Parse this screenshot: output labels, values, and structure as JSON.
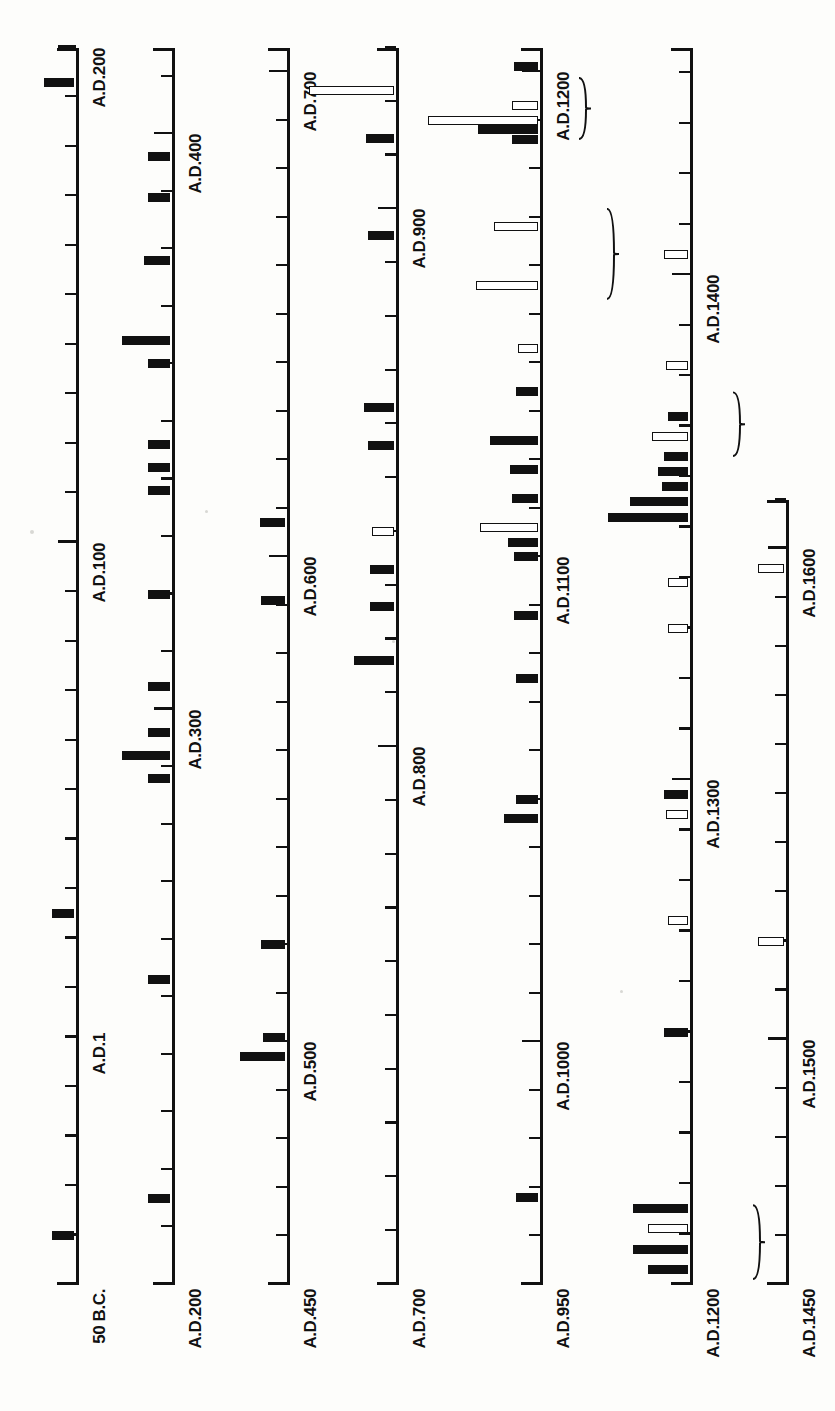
{
  "figure": {
    "orientation": "rotated-90-ccw",
    "background_color": "#fdfdfb",
    "ink_color": "#111111"
  },
  "chart_data": {
    "type": "bar",
    "xlabel": "",
    "ylabel": "",
    "grid": false,
    "legend": [],
    "note": "Seven stacked horizontal timeline axes (printed rotated 90 degrees). Each axis spans a date range with minor ticks every 10 years and labelled major ticks every 100 years (50 years on the later panels). Bars extend perpendicular from the axis; solid black bars and hollow (outlined) bars are two different categories. Curly braces group adjacent bars.",
    "rows": [
      {
        "index": 1,
        "start_label": "50 B.C.",
        "end_label": "A.D.200",
        "start_value": -50,
        "end_value": 200,
        "tick_step": 10,
        "major_ticks": [
          {
            "value": 1,
            "label": "A.D.1"
          },
          {
            "value": 100,
            "label": "A.D.100"
          },
          {
            "value": 200,
            "label": "A.D.200"
          }
        ],
        "bars": [
          {
            "value": -40,
            "length": 22,
            "style": "filled"
          },
          {
            "value": 25,
            "length": 22,
            "style": "filled"
          },
          {
            "value": 193,
            "length": 30,
            "style": "filled"
          }
        ]
      },
      {
        "index": 2,
        "start_label": "A.D.200",
        "end_label": "A.D.400",
        "start_value": 200,
        "end_value": 415,
        "tick_step": 10,
        "major_ticks": [
          {
            "value": 200,
            "label": "A.D.200"
          },
          {
            "value": 300,
            "label": "A.D.300"
          },
          {
            "value": 400,
            "label": "A.D.400"
          }
        ],
        "bars": [
          {
            "value": 215,
            "length": 22,
            "style": "filled"
          },
          {
            "value": 253,
            "length": 22,
            "style": "filled"
          },
          {
            "value": 288,
            "length": 22,
            "style": "filled"
          },
          {
            "value": 292,
            "length": 48,
            "style": "filled"
          },
          {
            "value": 296,
            "length": 22,
            "style": "filled"
          },
          {
            "value": 304,
            "length": 22,
            "style": "filled"
          },
          {
            "value": 320,
            "length": 22,
            "style": "filled"
          },
          {
            "value": 338,
            "length": 22,
            "style": "filled"
          },
          {
            "value": 342,
            "length": 22,
            "style": "filled"
          },
          {
            "value": 346,
            "length": 22,
            "style": "filled"
          },
          {
            "value": 360,
            "length": 22,
            "style": "filled"
          },
          {
            "value": 364,
            "length": 48,
            "style": "filled"
          },
          {
            "value": 378,
            "length": 26,
            "style": "filled"
          },
          {
            "value": 389,
            "length": 22,
            "style": "filled"
          },
          {
            "value": 396,
            "length": 22,
            "style": "filled"
          }
        ]
      },
      {
        "index": 3,
        "start_label": "A.D.450",
        "end_label": "A.D.700",
        "start_value": 450,
        "end_value": 705,
        "tick_step": 10,
        "major_ticks": [
          {
            "value": 500,
            "label": "A.D.500"
          },
          {
            "value": 600,
            "label": "A.D.600"
          },
          {
            "value": 700,
            "label": "A.D.700"
          }
        ],
        "bars": [
          {
            "value": 497,
            "length": 45,
            "style": "filled"
          },
          {
            "value": 501,
            "length": 22,
            "style": "filled"
          },
          {
            "value": 520,
            "length": 24,
            "style": "filled"
          },
          {
            "value": 591,
            "length": 24,
            "style": "filled"
          },
          {
            "value": 607,
            "length": 25,
            "style": "filled"
          }
        ]
      },
      {
        "index": 4,
        "start_label": "A.D.700",
        "end_label": "A.D.900",
        "start_value": 700,
        "end_value": 930,
        "tick_step": 10,
        "major_ticks": [
          {
            "value": 800,
            "label": "A.D.800"
          },
          {
            "value": 900,
            "label": "A.D.900"
          }
        ],
        "bars": [
          {
            "value": 816,
            "length": 40,
            "style": "filled"
          },
          {
            "value": 826,
            "length": 24,
            "style": "filled"
          },
          {
            "value": 833,
            "length": 24,
            "style": "filled"
          },
          {
            "value": 840,
            "length": 22,
            "style": "hollow"
          },
          {
            "value": 856,
            "length": 26,
            "style": "filled"
          },
          {
            "value": 863,
            "length": 30,
            "style": "filled"
          },
          {
            "value": 895,
            "length": 26,
            "style": "filled"
          },
          {
            "value": 913,
            "length": 28,
            "style": "filled"
          },
          {
            "value": 922,
            "length": 85,
            "style": "hollow"
          }
        ]
      },
      {
        "index": 5,
        "start_label": "A.D.950",
        "end_label": "A.D.1200",
        "start_value": 950,
        "end_value": 1205,
        "tick_step": 10,
        "major_ticks": [
          {
            "value": 1000,
            "label": "A.D.1000"
          },
          {
            "value": 1100,
            "label": "A.D.1100"
          },
          {
            "value": 1200,
            "label": "A.D.1200"
          }
        ],
        "bars": [
          {
            "value": 968,
            "length": 22,
            "style": "filled"
          },
          {
            "value": 1046,
            "length": 34,
            "style": "filled"
          },
          {
            "value": 1050,
            "length": 22,
            "style": "filled"
          },
          {
            "value": 1075,
            "length": 22,
            "style": "filled"
          },
          {
            "value": 1088,
            "length": 24,
            "style": "filled"
          },
          {
            "value": 1100,
            "length": 24,
            "style": "filled"
          },
          {
            "value": 1103,
            "length": 30,
            "style": "filled"
          },
          {
            "value": 1106,
            "length": 58,
            "style": "hollow"
          },
          {
            "value": 1112,
            "length": 26,
            "style": "filled"
          },
          {
            "value": 1118,
            "length": 28,
            "style": "filled"
          },
          {
            "value": 1124,
            "length": 48,
            "style": "filled"
          },
          {
            "value": 1134,
            "length": 22,
            "style": "filled"
          },
          {
            "value": 1143,
            "length": 20,
            "style": "hollow"
          },
          {
            "value": 1156,
            "length": 62,
            "style": "hollow"
          },
          {
            "value": 1168,
            "length": 44,
            "style": "hollow"
          },
          {
            "value": 1186,
            "length": 26,
            "style": "filled"
          },
          {
            "value": 1188,
            "length": 60,
            "style": "filled"
          },
          {
            "value": 1190,
            "length": 110,
            "style": "hollow"
          },
          {
            "value": 1193,
            "length": 26,
            "style": "hollow"
          },
          {
            "value": 1201,
            "length": 24,
            "style": "filled"
          }
        ],
        "braces": [
          {
            "from": 1153,
            "to": 1172,
            "offset": 62
          },
          {
            "from": 1186,
            "to": 1199,
            "offset": 34
          }
        ]
      },
      {
        "index": 6,
        "start_label": "A.D.1200",
        "end_label": "A.D.1400",
        "start_value": 1200,
        "end_value": 1445,
        "tick_step": 10,
        "major_ticks": [
          {
            "value": 1200,
            "label": "A.D.1200"
          },
          {
            "value": 1300,
            "label": "A.D.1300"
          },
          {
            "value": 1400,
            "label": "A.D.1400"
          }
        ],
        "bars": [
          {
            "value": 1203,
            "length": 40,
            "style": "filled"
          },
          {
            "value": 1207,
            "length": 55,
            "style": "filled"
          },
          {
            "value": 1211,
            "length": 40,
            "style": "hollow"
          },
          {
            "value": 1215,
            "length": 55,
            "style": "filled"
          },
          {
            "value": 1250,
            "length": 24,
            "style": "filled"
          },
          {
            "value": 1272,
            "length": 20,
            "style": "hollow"
          },
          {
            "value": 1293,
            "length": 22,
            "style": "hollow"
          },
          {
            "value": 1297,
            "length": 24,
            "style": "filled"
          },
          {
            "value": 1330,
            "length": 20,
            "style": "hollow"
          },
          {
            "value": 1339,
            "length": 20,
            "style": "hollow"
          },
          {
            "value": 1352,
            "length": 80,
            "style": "filled"
          },
          {
            "value": 1355,
            "length": 58,
            "style": "filled"
          },
          {
            "value": 1358,
            "length": 26,
            "style": "filled"
          },
          {
            "value": 1361,
            "length": 30,
            "style": "filled"
          },
          {
            "value": 1364,
            "length": 24,
            "style": "filled"
          },
          {
            "value": 1368,
            "length": 36,
            "style": "hollow"
          },
          {
            "value": 1372,
            "length": 20,
            "style": "filled"
          },
          {
            "value": 1382,
            "length": 22,
            "style": "hollow"
          },
          {
            "value": 1404,
            "length": 24,
            "style": "hollow"
          }
        ],
        "braces": [
          {
            "from": 1201,
            "to": 1216,
            "offset": 58
          },
          {
            "from": 1364,
            "to": 1377,
            "offset": 38
          }
        ]
      },
      {
        "index": 7,
        "start_label": "A.D.1450",
        "end_label": "A.D.1600",
        "start_value": 1450,
        "end_value": 1610,
        "tick_step": 10,
        "major_ticks": [
          {
            "value": 1500,
            "label": "A.D.1500"
          },
          {
            "value": 1600,
            "label": "A.D.1600"
          }
        ],
        "bars": [
          {
            "value": 1520,
            "length": 26,
            "style": "hollow"
          },
          {
            "value": 1596,
            "length": 26,
            "style": "hollow"
          }
        ]
      }
    ]
  }
}
